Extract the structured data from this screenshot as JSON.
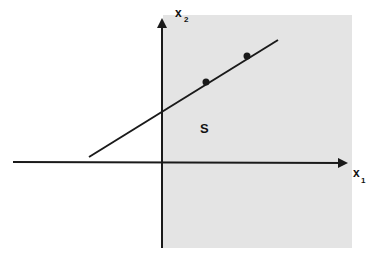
{
  "diagram": {
    "region_label": "S",
    "x_axis": {
      "label": "x",
      "subscript": "1"
    },
    "y_axis": {
      "label": "x",
      "subscript": "2"
    },
    "colors": {
      "region_fill": "#e4e4e4",
      "line": "#1a1a1a",
      "background": "#ffffff"
    },
    "elements": {
      "shaded_region": "half-plane x1 >= 0",
      "line": "straight line through two marked points",
      "points_count": 2
    }
  }
}
